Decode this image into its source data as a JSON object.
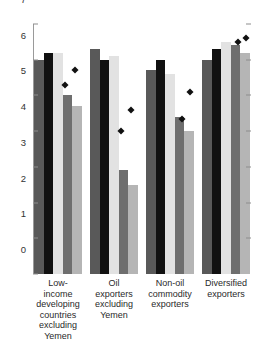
{
  "chart_data": {
    "type": "bar",
    "title": "",
    "subtitle": "",
    "xlabel": "",
    "ylabel": "",
    "ylim": [
      0,
      7
    ],
    "yticks": [
      0,
      1,
      2,
      3,
      4,
      5,
      6,
      7
    ],
    "ytick_labels": [
      "0",
      "1",
      "2",
      "3",
      "4",
      "5",
      "6",
      "7"
    ],
    "grid": false,
    "legend": "none",
    "categories": [
      "Low-income developing countries excluding Yemen",
      "Oil exporters excluding Yemen",
      "Non-oil commodity exporters",
      "Diversified exporters"
    ],
    "category_lines": [
      [
        "Low-income",
        "developing",
        "countries",
        "excluding",
        "Yemen"
      ],
      [
        "Oil exporters",
        "excluding",
        "Yemen"
      ],
      [
        "Non-oil",
        "commodity",
        "exporters"
      ],
      [
        "Diversified",
        "exporters"
      ]
    ],
    "series": [
      {
        "name": "series-1",
        "color": "#595959",
        "values": [
          6.0,
          6.3,
          5.7,
          6.0
        ]
      },
      {
        "name": "series-2",
        "color": "#111111",
        "values": [
          6.2,
          6.0,
          6.0,
          6.3
        ]
      },
      {
        "name": "series-3",
        "color": "#e2e2e2",
        "values": [
          6.2,
          6.1,
          5.6,
          6.5
        ]
      },
      {
        "name": "series-4",
        "color": "#6e6e6e",
        "values": [
          5.0,
          2.9,
          4.4,
          6.4
        ]
      },
      {
        "name": "series-5",
        "color": "#b5b5b5",
        "values": [
          4.7,
          2.5,
          4.0,
          6.2
        ]
      }
    ],
    "markers": {
      "name": "point-series",
      "color": "#111111",
      "shape": "diamond",
      "points": [
        {
          "group": 0,
          "slot": 3.05,
          "value": 5.3
        },
        {
          "group": 0,
          "slot": 4.05,
          "value": 5.7
        },
        {
          "group": 1,
          "slot": 3.05,
          "value": 4.0
        },
        {
          "group": 1,
          "slot": 4.05,
          "value": 4.6
        },
        {
          "group": 2,
          "slot": 3.55,
          "value": 4.35
        },
        {
          "group": 2,
          "slot": 4.35,
          "value": 5.1
        },
        {
          "group": 3,
          "slot": 3.55,
          "value": 6.5
        },
        {
          "group": 3,
          "slot": 4.35,
          "value": 6.6
        }
      ]
    }
  }
}
